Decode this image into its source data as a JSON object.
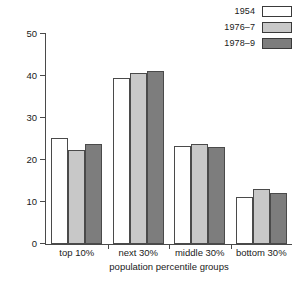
{
  "chart_data": {
    "type": "bar",
    "title": "",
    "xlabel": "population percentile groups",
    "ylabel": "percentage of total income",
    "categories": [
      "top 10%",
      "next 30%",
      "middle 30%",
      "bottom 30%"
    ],
    "series": [
      {
        "name": "1954",
        "color": "#ffffff",
        "values": [
          25.3,
          39.5,
          23.3,
          11.2
        ]
      },
      {
        "name": "1976–7",
        "color": "#c8c8c8",
        "values": [
          22.3,
          40.6,
          23.8,
          13.2
        ]
      },
      {
        "name": "1978–9",
        "color": "#7d7d7d",
        "values": [
          23.7,
          41.1,
          23.0,
          12.1
        ]
      }
    ],
    "ylim": [
      0,
      50
    ],
    "yticks": [
      0,
      10,
      20,
      30,
      40,
      50
    ],
    "ytick_labels": [
      "0",
      "10",
      "20",
      "30",
      "40",
      "50"
    ],
    "grid": false,
    "legend_position": "top-right",
    "axis_color": "#4a4a4a",
    "bar_edge_color": "#4a4a4a"
  },
  "legend": {
    "entries": [
      {
        "label": "1954"
      },
      {
        "label": "1976–7"
      },
      {
        "label": "1978–9"
      }
    ]
  }
}
